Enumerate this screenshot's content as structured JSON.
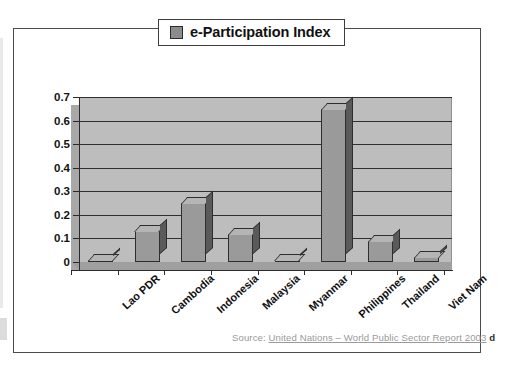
{
  "legend": {
    "swatch_color": "#8c8c8c",
    "label": "e-Participation Index"
  },
  "source": {
    "prefix": "Source: ",
    "link_text": "United Nations – World Public Sector Report 2003",
    "trailing": "d"
  },
  "chart_data": {
    "type": "bar",
    "title": "",
    "subtitle": "",
    "xlabel": "",
    "ylabel": "",
    "ylim": [
      0,
      0.7
    ],
    "yticks": [
      "0",
      "0.1",
      "0.2",
      "0.3",
      "0.4",
      "0.5",
      "0.6",
      "0.7"
    ],
    "ytick_values": [
      0,
      0.1,
      0.2,
      0.3,
      0.4,
      0.5,
      0.6,
      0.7
    ],
    "grid": true,
    "grid_axis": "y",
    "legend_position": "top-center",
    "three_d": true,
    "bar_color": "#9a9a9a",
    "plot_background": "#bdbdbd",
    "categories": [
      "Lao PDR",
      "Cambodia",
      "Indonesia",
      "Malaysia",
      "Myanmar",
      "Philippines",
      "Thailand",
      "Viet Nam"
    ],
    "series": [
      {
        "name": "e-Participation Index",
        "values": [
          0.01,
          0.13,
          0.25,
          0.12,
          0.01,
          0.65,
          0.09,
          0.02
        ]
      }
    ]
  }
}
